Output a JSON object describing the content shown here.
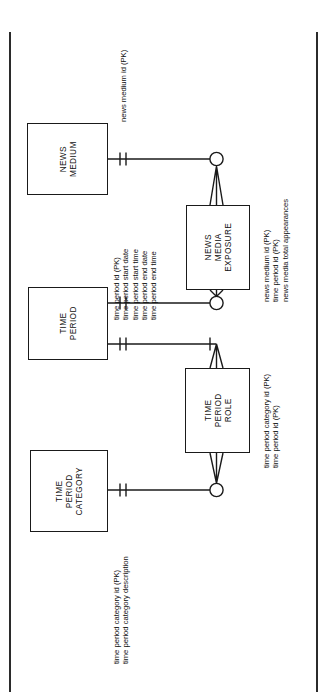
{
  "diagram": {
    "type": "entity-relationship-diagram",
    "notation": "information-engineering-crows-foot",
    "orientation": "rotated-90-counterclockwise",
    "entities": [
      {
        "id": "news-medium",
        "name_lines": [
          "NEWS",
          "MEDIUM"
        ],
        "attributes": [
          "news medium id (PK)"
        ]
      },
      {
        "id": "time-period",
        "name_lines": [
          "TIME",
          "PERIOD"
        ],
        "attributes": [
          "time period id (PK)",
          "time period start date",
          "time period start time",
          "time period end date",
          "time period end time"
        ]
      },
      {
        "id": "news-media-exposure",
        "name_lines": [
          "NEWS",
          "MEDIA",
          "EXPOSURE"
        ],
        "attributes": [
          "news medium id (PK)",
          "time period id (PK)",
          "news media total appearances"
        ]
      },
      {
        "id": "time-period-role",
        "name_lines": [
          "TIME",
          "PERIOD",
          "ROLE"
        ],
        "attributes": [
          "time period category id (PK)",
          "time period id (PK)"
        ]
      },
      {
        "id": "time-period-category",
        "name_lines": [
          "TIME",
          "PERIOD",
          "CATEGORY"
        ],
        "attributes": [
          "time period category id (PK)",
          "time period category description"
        ]
      }
    ],
    "relationships": [
      {
        "id": "news-medium-to-news-media-exposure",
        "from": "NEWS MEDIUM",
        "to": "NEWS MEDIA EXPOSURE",
        "from_cardinality": "one and only one",
        "to_cardinality": "zero or many"
      },
      {
        "id": "time-period-to-news-media-exposure",
        "from": "TIME PERIOD",
        "to": "NEWS MEDIA EXPOSURE",
        "from_cardinality": "one and only one",
        "to_cardinality": "zero or many"
      },
      {
        "id": "time-period-to-time-period-role",
        "from": "TIME PERIOD",
        "to": "TIME PERIOD ROLE",
        "from_cardinality": "one and only one",
        "to_cardinality": "one or many"
      },
      {
        "id": "time-period-category-to-time-period-role",
        "from": "TIME PERIOD CATEGORY",
        "to": "TIME PERIOD ROLE",
        "from_cardinality": "one and only one",
        "to_cardinality": "zero or many"
      }
    ],
    "colors": {
      "stroke": "#1a1a1a",
      "background": "#ffffff",
      "text": "#111111"
    }
  }
}
